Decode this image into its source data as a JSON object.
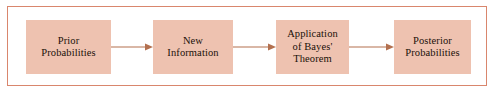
{
  "figure": {
    "type": "flow-diagram",
    "border_color": "#d9866d",
    "box_fill_color": "#eec2b0",
    "arrow_color": "#b3704f",
    "text_color": "#1a1008",
    "background_color": "#ffffff"
  },
  "boxes": [
    {
      "id": "prior",
      "label": "Prior\nProbabilities"
    },
    {
      "id": "new-info",
      "label": "New\nInformation"
    },
    {
      "id": "bayes",
      "label": "Application\nof Bayes'\nTheorem"
    },
    {
      "id": "posterior",
      "label": "Posterior\nProbabilities"
    }
  ],
  "arrows": [
    {
      "id": "arrow-1",
      "from": "prior",
      "to": "new-info",
      "direction": "right"
    },
    {
      "id": "arrow-2",
      "from": "new-info",
      "to": "bayes",
      "direction": "right"
    },
    {
      "id": "arrow-3",
      "from": "bayes",
      "to": "posterior",
      "direction": "right"
    }
  ]
}
